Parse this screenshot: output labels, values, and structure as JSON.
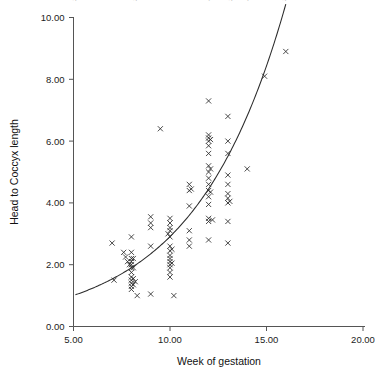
{
  "chart_data": {
    "type": "scatter",
    "title": "Fig. 4.2  Scatter diagram of head to coccyx length by week of gestation",
    "xlabel": "Week of gestation",
    "ylabel": "Head to Coccyx length",
    "xlim": [
      5.0,
      20.0
    ],
    "ylim": [
      0.0,
      10.0
    ],
    "xticks": [
      "5.00",
      "10.00",
      "15.00",
      "20.00"
    ],
    "xtick_values": [
      5,
      10,
      15,
      20
    ],
    "yticks": [
      "0.00",
      "2.00",
      "4.00",
      "6.00",
      "8.00",
      "10.00"
    ],
    "ytick_values": [
      0,
      2,
      4,
      6,
      8,
      10
    ],
    "grid": false,
    "legend": false,
    "marker": "x",
    "marker_color": "#2a2a2a",
    "points": [
      [
        7.0,
        2.7
      ],
      [
        7.1,
        1.5
      ],
      [
        7.6,
        2.4
      ],
      [
        7.7,
        2.25
      ],
      [
        7.8,
        2.1
      ],
      [
        7.9,
        2.0
      ],
      [
        8.0,
        2.9
      ],
      [
        8.0,
        2.4
      ],
      [
        8.0,
        2.2
      ],
      [
        8.0,
        2.1
      ],
      [
        8.0,
        2.0
      ],
      [
        8.0,
        1.9
      ],
      [
        8.0,
        1.75
      ],
      [
        8.0,
        1.6
      ],
      [
        8.0,
        1.5
      ],
      [
        8.0,
        1.4
      ],
      [
        8.0,
        1.3
      ],
      [
        8.0,
        1.2
      ],
      [
        8.1,
        2.2
      ],
      [
        8.1,
        1.9
      ],
      [
        8.1,
        1.55
      ],
      [
        8.1,
        1.35
      ],
      [
        8.2,
        1.45
      ],
      [
        8.3,
        1.0
      ],
      [
        9.0,
        3.55
      ],
      [
        9.0,
        3.35
      ],
      [
        9.0,
        3.2
      ],
      [
        9.0,
        2.6
      ],
      [
        9.0,
        1.05
      ],
      [
        9.5,
        6.4
      ],
      [
        9.9,
        3.0
      ],
      [
        10.0,
        3.5
      ],
      [
        10.0,
        3.35
      ],
      [
        10.0,
        3.2
      ],
      [
        10.0,
        3.1
      ],
      [
        10.0,
        2.9
      ],
      [
        10.0,
        2.6
      ],
      [
        10.0,
        2.45
      ],
      [
        10.0,
        2.3
      ],
      [
        10.0,
        2.2
      ],
      [
        10.0,
        2.1
      ],
      [
        10.0,
        2.0
      ],
      [
        10.0,
        1.9
      ],
      [
        10.0,
        1.75
      ],
      [
        10.0,
        1.6
      ],
      [
        10.1,
        2.5
      ],
      [
        10.1,
        2.05
      ],
      [
        10.2,
        1.0
      ],
      [
        11.0,
        4.6
      ],
      [
        11.0,
        4.4
      ],
      [
        11.0,
        3.9
      ],
      [
        11.0,
        3.1
      ],
      [
        11.0,
        2.8
      ],
      [
        11.0,
        2.6
      ],
      [
        11.1,
        4.45
      ],
      [
        12.0,
        7.3
      ],
      [
        12.0,
        6.2
      ],
      [
        12.0,
        6.1
      ],
      [
        12.0,
        6.0
      ],
      [
        12.0,
        5.85
      ],
      [
        12.0,
        5.6
      ],
      [
        12.0,
        5.2
      ],
      [
        12.0,
        5.0
      ],
      [
        12.0,
        4.8
      ],
      [
        12.0,
        4.6
      ],
      [
        12.0,
        4.4
      ],
      [
        12.0,
        4.2
      ],
      [
        12.0,
        3.95
      ],
      [
        12.0,
        3.5
      ],
      [
        12.0,
        3.4
      ],
      [
        12.0,
        2.8
      ],
      [
        12.1,
        6.05
      ],
      [
        12.1,
        5.1
      ],
      [
        12.1,
        4.35
      ],
      [
        12.2,
        3.45
      ],
      [
        13.0,
        6.8
      ],
      [
        13.0,
        6.0
      ],
      [
        13.0,
        5.6
      ],
      [
        13.0,
        4.9
      ],
      [
        13.0,
        4.6
      ],
      [
        13.0,
        4.3
      ],
      [
        13.0,
        4.15
      ],
      [
        13.0,
        4.0
      ],
      [
        13.0,
        3.4
      ],
      [
        13.0,
        2.7
      ],
      [
        13.1,
        4.05
      ],
      [
        14.0,
        5.1
      ],
      [
        14.9,
        8.1
      ],
      [
        16.0,
        8.9
      ]
    ],
    "fit_curve": {
      "label": "fitted exponential curve",
      "x_start": 5.1,
      "x_end": 16.0,
      "a": 0.3465,
      "b": 0.2128,
      "color": "#2b2b2b"
    }
  }
}
